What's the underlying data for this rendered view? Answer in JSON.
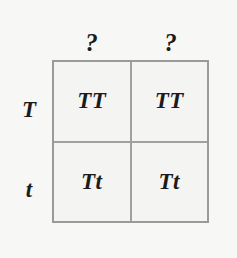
{
  "figure": {
    "type": "punnett-square",
    "background_color": "#f7f7f6",
    "grid_line_color": "#9a9a9a",
    "text_color": "#1b1b1b"
  },
  "column_headers": [
    {
      "label": "?"
    },
    {
      "label": "?"
    }
  ],
  "row_headers": [
    {
      "label": "T"
    },
    {
      "label": "t"
    }
  ],
  "cells": [
    [
      {
        "genotype": "TT"
      },
      {
        "genotype": "TT"
      }
    ],
    [
      {
        "genotype": "Tt"
      },
      {
        "genotype": "Tt"
      }
    ]
  ]
}
